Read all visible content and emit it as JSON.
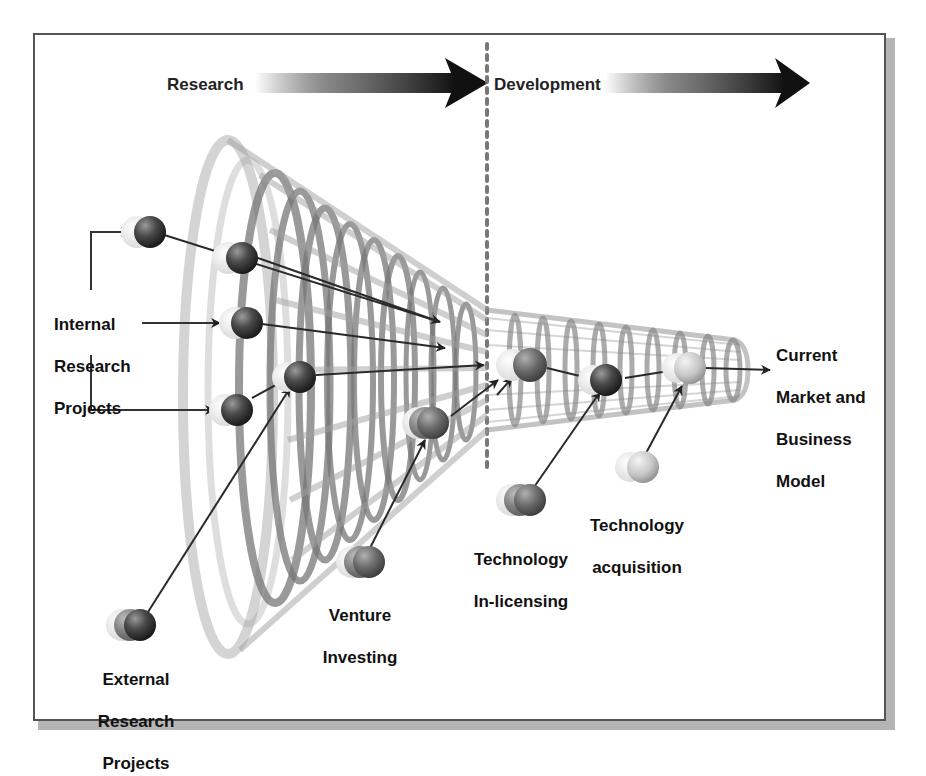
{
  "phases": {
    "research": "Research",
    "development": "Development"
  },
  "labels": {
    "internal": [
      "Internal",
      "Research",
      "Projects"
    ],
    "external": [
      "External",
      "Research",
      "Projects"
    ],
    "venture": [
      "Venture",
      "Investing"
    ],
    "inlicensing": [
      "Technology",
      "In-licensing"
    ],
    "acquisition": [
      "Technology",
      "acquisition"
    ],
    "output": [
      "Current",
      "Market and",
      "Business",
      "Model"
    ]
  },
  "colors": {
    "arrow_dark": "#1a1a1a",
    "sphere_dark": "#3a3a3a",
    "sphere_mid": "#6e6e6e",
    "sphere_light": "#cfcfcf",
    "funnel": "#9a9a9a",
    "divider": "#777777",
    "frame": "#555555"
  }
}
